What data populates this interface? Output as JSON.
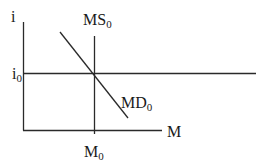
{
  "diagram": {
    "type": "money-market",
    "axes": {
      "y_label": "i",
      "x_label": "M"
    },
    "curves": {
      "supply": {
        "base": "MS",
        "sub": "0"
      },
      "demand": {
        "base": "MD",
        "sub": "0"
      }
    },
    "equilibrium": {
      "rate": {
        "base": "i",
        "sub": "0"
      },
      "quantity": {
        "base": "M",
        "sub": "0"
      }
    },
    "colors": {
      "line": "#2a2a2a",
      "text": "#1a1a1a",
      "background": "#ffffff"
    }
  }
}
